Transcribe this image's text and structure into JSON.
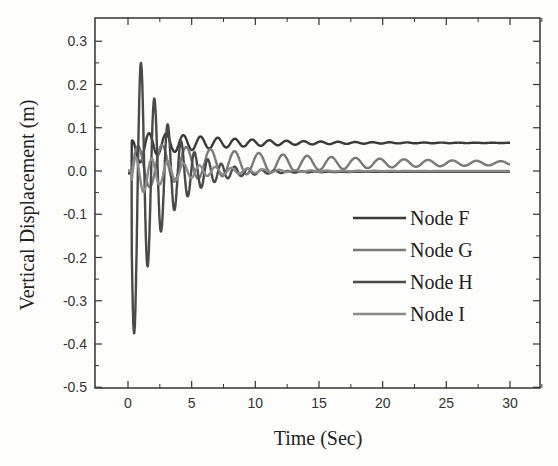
{
  "chart_data": {
    "type": "line",
    "title": "",
    "xlabel": "Time (Sec)",
    "ylabel": "Vertical Displacement (m)",
    "xlim": [
      -2.5,
      32.5
    ],
    "ylim": [
      -0.5,
      0.35
    ],
    "xticks": [
      0,
      5,
      10,
      15,
      20,
      25,
      30
    ],
    "xtick_labels": [
      "0",
      "5",
      "10",
      "15",
      "20",
      "25",
      "30"
    ],
    "yticks": [
      -0.5,
      -0.4,
      -0.3,
      -0.2,
      -0.1,
      0.0,
      0.1,
      0.2,
      0.3
    ],
    "ytick_labels": [
      "-0.5",
      "-0.4",
      "-0.3",
      "-0.2",
      "-0.1",
      "0.0",
      "0.1",
      "0.2",
      "0.3"
    ],
    "grid": false,
    "legend_position": "center right",
    "series": [
      {
        "name": "Node F",
        "color": "#3a3a3a",
        "final_value": 0.065,
        "amplitude": 0.04,
        "period": 1.55,
        "decay": 0.22,
        "start": 0.2,
        "first_value": 0.095
      },
      {
        "name": "Node G",
        "color": "#7a7a7a",
        "final_value": 0.018,
        "amplitude": 0.06,
        "period": 1.85,
        "decay": 0.09,
        "start": 0.2,
        "first_value": 0.06
      },
      {
        "name": "Node H",
        "color": "#4a4a4a",
        "final_value": -0.002,
        "amplitude": 0.3,
        "period": 1.1,
        "decay": 0.35,
        "start": 0.2,
        "first_value": -0.41,
        "peak_value": 0.285
      },
      {
        "name": "Node I",
        "color": "#8a8a8a",
        "final_value": 0.0,
        "amplitude": 0.05,
        "period": 1.3,
        "decay": 0.3,
        "start": 0.2,
        "first_value": -0.02
      }
    ],
    "notable_points": [
      {
        "series": "Node H",
        "x": 0.5,
        "y": -0.41
      },
      {
        "series": "Node H",
        "x": 1.0,
        "y": 0.285
      },
      {
        "series": "Node H",
        "x": 1.5,
        "y": -0.26
      },
      {
        "series": "Node H",
        "x": 2.0,
        "y": 0.22
      },
      {
        "series": "Node H",
        "x": 2.5,
        "y": -0.21
      },
      {
        "series": "Node H",
        "x": 3.1,
        "y": 0.18
      },
      {
        "series": "Node H",
        "x": 3.5,
        "y": -0.16
      }
    ]
  },
  "legend": {
    "items": [
      "Node F",
      "Node G",
      "Node H",
      "Node I"
    ]
  }
}
